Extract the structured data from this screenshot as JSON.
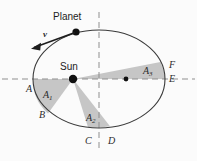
{
  "figure": {
    "title_objects": {
      "planet_label": "Planet",
      "sun_label": "Sun",
      "velocity_label": "v"
    },
    "area_labels": [
      {
        "id": "A1",
        "base": "A",
        "sub": "1"
      },
      {
        "id": "A2",
        "base": "A",
        "sub": "2"
      },
      {
        "id": "A3",
        "base": "A",
        "sub": "3"
      }
    ],
    "point_labels": {
      "A": "A",
      "B": "B",
      "C": "C",
      "D": "D",
      "E": "E",
      "F": "F"
    },
    "colors": {
      "background": "#fbfbfb",
      "orbit_stroke": "#3a3a3a",
      "wedge_fill": "#c6c6c6",
      "axis_dash": "#8f8f8f",
      "marker": "#111111",
      "label_text": "#2b2b2b"
    },
    "geometry": {
      "ellipse_center_x": 99,
      "ellipse_center_y": 79,
      "ellipse_rx": 66,
      "ellipse_ry": 49,
      "sun_focus_x": 73,
      "sun_focus_y": 79,
      "second_focus_x": 126,
      "second_focus_y": 79,
      "planet_x": 76,
      "planet_y": 32
    }
  }
}
